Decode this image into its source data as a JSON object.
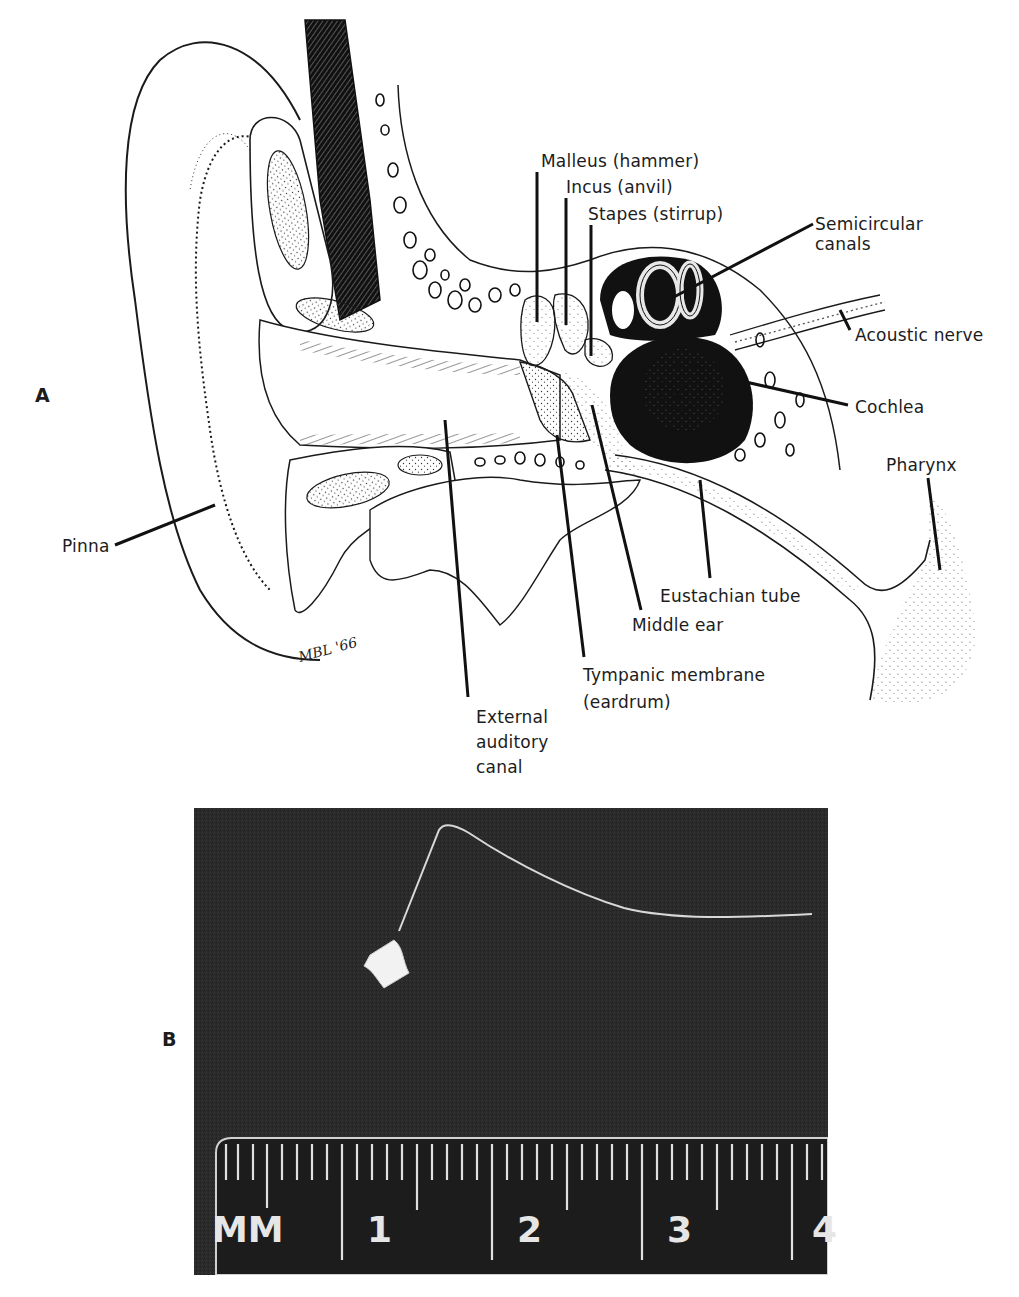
{
  "figure": {
    "panel_a": {
      "letter": "A",
      "labels": {
        "malleus": "Malleus (hammer)",
        "incus": "Incus (anvil)",
        "stapes": "Stapes (stirrup)",
        "semicircular_1": "Semicircular",
        "semicircular_2": "canals",
        "acoustic_nerve": "Acoustic nerve",
        "cochlea": "Cochlea",
        "pharynx": "Pharynx",
        "pinna": "Pinna",
        "eustachian_tube": "Eustachian tube",
        "middle_ear": "Middle ear",
        "tympanic_1": "Tympanic membrane",
        "tympanic_2": "(eardrum)",
        "external_1": "External",
        "external_2": "auditory",
        "external_3": "canal"
      },
      "artist_signature": "MBL '66"
    },
    "panel_b": {
      "letter": "B",
      "ruler": {
        "unit_label": "MM",
        "numbers": [
          "1",
          "2",
          "3",
          "4"
        ]
      }
    }
  }
}
